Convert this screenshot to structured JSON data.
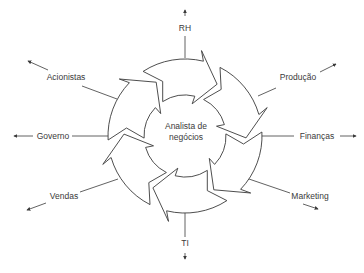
{
  "diagram": {
    "center": {
      "label_line1": "Analista de",
      "label_line2": "negócios"
    },
    "colors": {
      "stroke": "#3a3a3a",
      "fill": "#ffffff",
      "text": "#3a3a3a"
    },
    "ring": {
      "cx": 185,
      "cy": 136,
      "outer_radius": 77,
      "inner_radius": 41,
      "arrow_count": 6,
      "direction": "clockwise"
    },
    "stakeholders": [
      {
        "id": "rh",
        "label": "RH",
        "x": 185,
        "y": 31,
        "anchor": "middle",
        "line": [
          185,
          36,
          185,
          58
        ],
        "arrow": [
          185,
          16,
          185,
          10
        ]
      },
      {
        "id": "producao",
        "label": "Produção",
        "x": 298,
        "y": 80,
        "anchor": "middle",
        "line": [
          258,
          96,
          276,
          88
        ],
        "arrow": [
          320,
          72,
          336,
          64
        ]
      },
      {
        "id": "financas",
        "label": "Finanças",
        "x": 317,
        "y": 139,
        "anchor": "middle",
        "line": [
          262,
          136,
          294,
          136
        ],
        "arrow": [
          340,
          136,
          356,
          136
        ]
      },
      {
        "id": "marketing",
        "label": "Marketing",
        "x": 310,
        "y": 199,
        "anchor": "middle",
        "line": [
          246,
          178,
          290,
          193
        ],
        "arrow": [
          303,
          204,
          318,
          209
        ]
      },
      {
        "id": "ti",
        "label": "TI",
        "x": 185,
        "y": 246,
        "anchor": "middle",
        "line": [
          185,
          213,
          185,
          237
        ],
        "arrow": [
          185,
          253,
          185,
          259
        ]
      },
      {
        "id": "vendas",
        "label": "Vendas",
        "x": 64,
        "y": 199,
        "anchor": "middle",
        "line": [
          118,
          179,
          80,
          192
        ],
        "arrow": [
          46,
          203,
          27,
          210
        ]
      },
      {
        "id": "governo",
        "label": "Governo",
        "x": 53,
        "y": 139,
        "anchor": "middle",
        "line": [
          108,
          136,
          72,
          136
        ],
        "arrow": [
          33,
          136,
          14,
          136
        ]
      },
      {
        "id": "acionistas",
        "label": "Acionistas",
        "x": 66,
        "y": 80,
        "anchor": "middle",
        "line": [
          117,
          99,
          82,
          86
        ],
        "arrow": [
          48,
          70,
          28,
          61
        ]
      }
    ]
  }
}
